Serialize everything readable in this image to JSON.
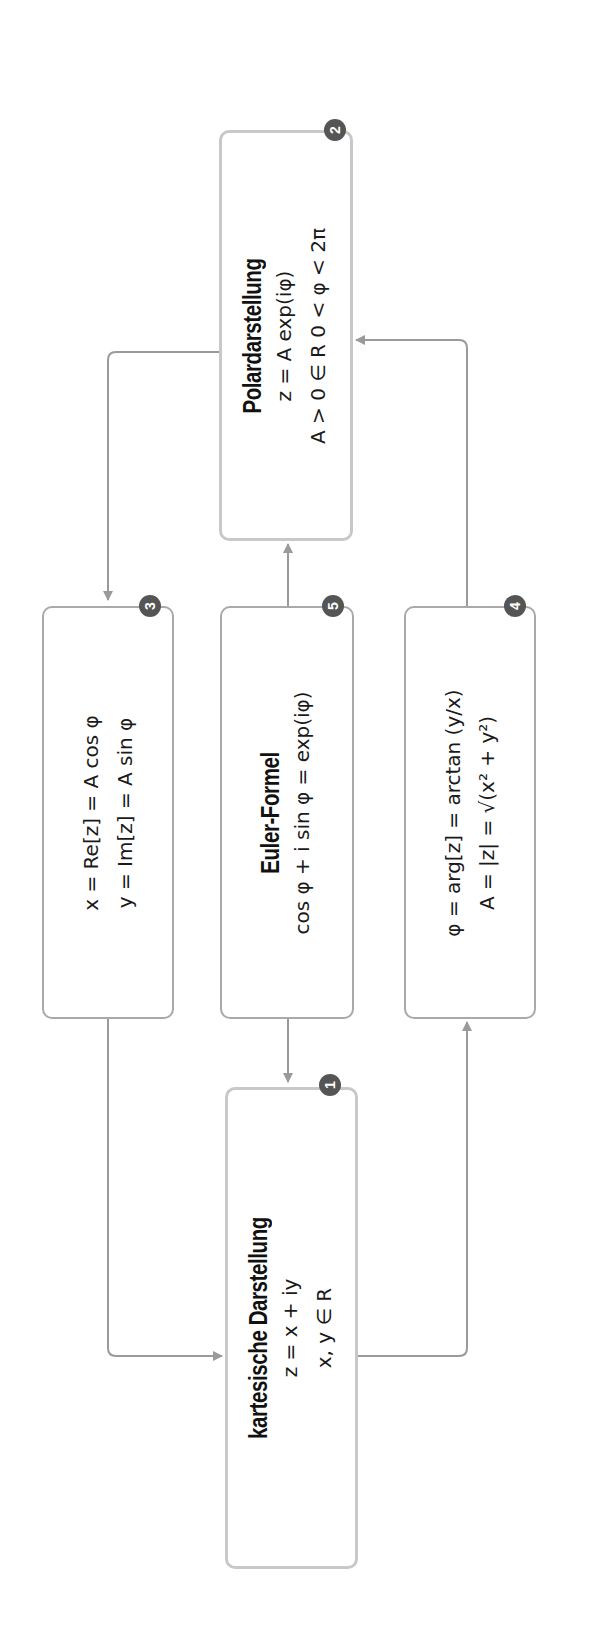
{
  "diagram": {
    "orientation": "rotated -90deg (text reads bottom-to-top)",
    "colors": {
      "box_border": "#a9a9a9",
      "box_border_highlight": "#c8c8c8",
      "connector": "#9a9a9a",
      "badge_fill": "#555555",
      "badge_text": "#ffffff",
      "text": "#1a1a1a"
    },
    "nodes": [
      {
        "id": "1",
        "badge": "1",
        "title": "kartesische Darstellung",
        "lines": [
          "z = x + iy",
          "x, y ∈ R"
        ]
      },
      {
        "id": "2",
        "badge": "2",
        "title": "Polardarstellung",
        "lines": [
          "z = A exp(iφ)",
          "A > 0 ∈ R   0 < φ < 2π"
        ]
      },
      {
        "id": "3",
        "badge": "3",
        "title": "",
        "lines": [
          "x = Re[z] = A cos φ",
          "y = Im[z] = A sin φ"
        ]
      },
      {
        "id": "4",
        "badge": "4",
        "title": "",
        "lines": [
          "φ = arg[z] = arctan (y/x)",
          "A = |z| = √(x² + y²)"
        ]
      },
      {
        "id": "5",
        "badge": "5",
        "title": "Euler-Formel",
        "lines": [
          "cos φ + i sin φ = exp(iφ)"
        ]
      }
    ],
    "edges": [
      {
        "from": "1",
        "to": "4"
      },
      {
        "from": "4",
        "to": "2"
      },
      {
        "from": "2",
        "to": "3"
      },
      {
        "from": "3",
        "to": "1"
      },
      {
        "from": "5",
        "to": "2"
      },
      {
        "from": "5",
        "to": "1"
      }
    ]
  }
}
